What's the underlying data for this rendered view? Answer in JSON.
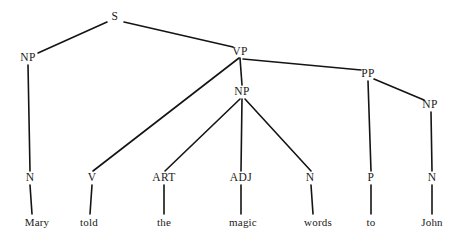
{
  "diagram": {
    "type": "constituency-parse-tree",
    "sentence": "Mary told the magic words to John",
    "background_color": "#ffffff",
    "ink_color": "#1a1a18",
    "edge_color": "#141412"
  },
  "nodes": {
    "s": {
      "label": "S",
      "x": 115,
      "y": 17,
      "kind": "phrasal"
    },
    "np_subj": {
      "label": "NP",
      "x": 28,
      "y": 58,
      "kind": "phrasal"
    },
    "vp": {
      "label": "VP",
      "x": 240,
      "y": 52,
      "kind": "phrasal"
    },
    "np_obj": {
      "label": "NP",
      "x": 242,
      "y": 92,
      "kind": "phrasal"
    },
    "pp": {
      "label": "PP",
      "x": 368,
      "y": 74,
      "kind": "phrasal"
    },
    "np_pobj": {
      "label": "NP",
      "x": 430,
      "y": 105,
      "kind": "phrasal"
    },
    "n_mary": {
      "label": "N",
      "x": 30,
      "y": 178,
      "kind": "pos"
    },
    "v_told": {
      "label": "V",
      "x": 92,
      "y": 178,
      "kind": "pos"
    },
    "art_the": {
      "label": "ART",
      "x": 164,
      "y": 178,
      "kind": "pos"
    },
    "adj_magic": {
      "label": "ADJ",
      "x": 241,
      "y": 178,
      "kind": "pos"
    },
    "n_words": {
      "label": "N",
      "x": 310,
      "y": 178,
      "kind": "pos"
    },
    "p_to": {
      "label": "P",
      "x": 371,
      "y": 178,
      "kind": "pos"
    },
    "n_john": {
      "label": "N",
      "x": 432,
      "y": 178,
      "kind": "pos"
    },
    "w_mary": {
      "label": "Mary",
      "x": 37,
      "y": 222,
      "kind": "word"
    },
    "w_told": {
      "label": "told",
      "x": 89,
      "y": 222,
      "kind": "word"
    },
    "w_the": {
      "label": "the",
      "x": 164,
      "y": 222,
      "kind": "word"
    },
    "w_magic": {
      "label": "magic",
      "x": 243,
      "y": 222,
      "kind": "word"
    },
    "w_words": {
      "label": "words",
      "x": 318,
      "y": 222,
      "kind": "word"
    },
    "w_to": {
      "label": "to",
      "x": 371,
      "y": 222,
      "kind": "word"
    },
    "w_john": {
      "label": "John",
      "x": 432,
      "y": 222,
      "kind": "word"
    }
  },
  "edges": [
    {
      "from": "s",
      "to": "np_subj",
      "x1": 107,
      "y1": 22,
      "x2": 38,
      "y2": 53
    },
    {
      "from": "s",
      "to": "vp",
      "x1": 124,
      "y1": 22,
      "x2": 233,
      "y2": 47
    },
    {
      "from": "np_subj",
      "to": "n_mary",
      "x1": 28,
      "y1": 65,
      "x2": 30,
      "y2": 171
    },
    {
      "from": "vp",
      "to": "v_told",
      "x1": 239,
      "y1": 58,
      "x2": 93,
      "y2": 171
    },
    {
      "from": "vp",
      "to": "np_obj",
      "x1": 240,
      "y1": 58,
      "x2": 242,
      "y2": 85
    },
    {
      "from": "vp",
      "to": "pp",
      "x1": 243,
      "y1": 59,
      "x2": 361,
      "y2": 70
    },
    {
      "from": "np_obj",
      "to": "art_the",
      "x1": 240,
      "y1": 99,
      "x2": 165,
      "y2": 171
    },
    {
      "from": "np_obj",
      "to": "adj_magic",
      "x1": 242,
      "y1": 99,
      "x2": 241,
      "y2": 171
    },
    {
      "from": "np_obj",
      "to": "n_words",
      "x1": 245,
      "y1": 99,
      "x2": 311,
      "y2": 171
    },
    {
      "from": "pp",
      "to": "p_to",
      "x1": 368,
      "y1": 81,
      "x2": 371,
      "y2": 171
    },
    {
      "from": "pp",
      "to": "np_pobj",
      "x1": 374,
      "y1": 79,
      "x2": 424,
      "y2": 100
    },
    {
      "from": "np_pobj",
      "to": "n_john",
      "x1": 431,
      "y1": 112,
      "x2": 432,
      "y2": 171
    },
    {
      "from": "n_mary",
      "to": "w_mary",
      "x1": 30,
      "y1": 185,
      "x2": 32,
      "y2": 214
    },
    {
      "from": "v_told",
      "to": "w_told",
      "x1": 92,
      "y1": 185,
      "x2": 90,
      "y2": 214
    },
    {
      "from": "art_the",
      "to": "w_the",
      "x1": 164,
      "y1": 185,
      "x2": 164,
      "y2": 214
    },
    {
      "from": "adj_magic",
      "to": "w_magic",
      "x1": 241,
      "y1": 185,
      "x2": 241,
      "y2": 214
    },
    {
      "from": "n_words",
      "to": "w_words",
      "x1": 311,
      "y1": 185,
      "x2": 313,
      "y2": 214
    },
    {
      "from": "p_to",
      "to": "w_to",
      "x1": 371,
      "y1": 185,
      "x2": 371,
      "y2": 214
    },
    {
      "from": "n_john",
      "to": "w_john",
      "x1": 432,
      "y1": 185,
      "x2": 432,
      "y2": 214
    }
  ]
}
